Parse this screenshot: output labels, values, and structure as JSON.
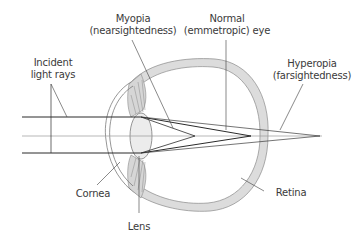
{
  "diagram": {
    "labels": {
      "myopia": {
        "line1": "Myopia",
        "line2": "(nearsightedness)"
      },
      "normal": {
        "line1": "Normal",
        "line2": "(emmetropic) eye"
      },
      "hyperopia": {
        "line1": "Hyperopia",
        "line2": "(farsightedness)"
      },
      "incident": {
        "line1": "Incident",
        "line2": "light rays"
      },
      "cornea": "Cornea",
      "lens": "Lens",
      "retina": "Retina"
    },
    "colors": {
      "line": "#2b2b2b",
      "axis": "#9a9a9a",
      "tissue_fill": "#d9d9d9",
      "tissue_stroke": "#8a8a8a",
      "label_text": "#3a3a3a"
    },
    "focal_points": {
      "myopia_x": 195,
      "normal_x": 251,
      "hyperopia_x": 320
    }
  }
}
